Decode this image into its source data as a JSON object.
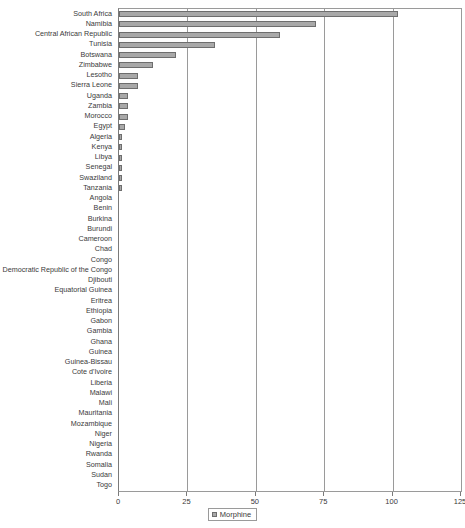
{
  "chart_data": {
    "type": "bar",
    "orientation": "horizontal",
    "title": "",
    "xlabel": "",
    "ylabel": "",
    "xlim": [
      0,
      125
    ],
    "xticks": [
      0,
      25,
      50,
      75,
      100,
      125
    ],
    "xtick_labels": [
      "0",
      "25",
      "50",
      "75",
      "100",
      "125"
    ],
    "grid": true,
    "grid_axis": "x",
    "legend": {
      "position": "bottom-center",
      "entries": [
        {
          "name": "Morphine",
          "color": "#a9a9a9"
        }
      ]
    },
    "series": [
      {
        "name": "Morphine",
        "color": "#a9a9a9",
        "values": [
          102,
          72,
          59,
          35,
          21,
          12.5,
          7,
          7,
          3.4,
          3.4,
          3.4,
          2.2,
          1.2,
          1.2,
          1.2,
          1.2,
          1.2,
          1.2,
          0,
          0,
          0,
          0,
          0,
          0,
          0,
          0,
          0,
          0,
          0,
          0,
          0,
          0,
          0,
          0,
          0,
          0,
          0,
          0,
          0,
          0,
          0,
          0,
          0,
          0,
          0,
          0,
          0
        ]
      }
    ],
    "categories": [
      "South Africa",
      "Namibia",
      "Central African Republic",
      "Tunisia",
      "Botswana",
      "Zimbabwe",
      "Lesotho",
      "Sierra Leone",
      "Uganda",
      "Zambia",
      "Morocco",
      "Egypt",
      "Algeria",
      "Kenya",
      "Libya",
      "Senegal",
      "Swaziland",
      "Tanzania",
      "Angola",
      "Benin",
      "Burkina",
      "Burundi",
      "Cameroon",
      "Chad",
      "Congo",
      "Democratic Republic of the Congo",
      "Djibouti",
      "Equatorial Guinea",
      "Eritrea",
      "Ethiopia",
      "Gabon",
      "Gambia",
      "Ghana",
      "Guinea",
      "Guinea-Bissau",
      "Cote d'Ivoire",
      "Liberia",
      "Malawi",
      "Mali",
      "Mauritania",
      "Mozambique",
      "Niger",
      "Nigeria",
      "Rwanda",
      "Somalia",
      "Sudan",
      "Togo"
    ]
  }
}
